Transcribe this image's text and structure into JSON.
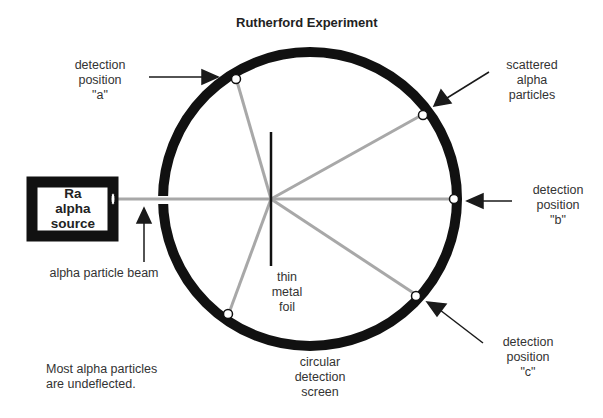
{
  "title": "Rutherford Experiment",
  "source_box": {
    "line1": "Ra",
    "line2": "alpha",
    "line3": "source"
  },
  "labels": {
    "position_a": {
      "line1": "detection",
      "line2": "position",
      "line3": "\"a\""
    },
    "scattered": {
      "line1": "scattered",
      "line2": "alpha",
      "line3": "particles"
    },
    "position_b": {
      "line1": "detection",
      "line2": "position",
      "line3": "\"b\""
    },
    "position_c": {
      "line1": "detection",
      "line2": "position",
      "line3": "\"c\""
    },
    "beam": "alpha particle beam",
    "foil": {
      "line1": "thin",
      "line2": "metal",
      "line3": "foil"
    },
    "screen": {
      "line1": "circular",
      "line2": "detection",
      "line3": "screen"
    },
    "note": {
      "line1": "Most alpha particles",
      "line2": "are undeflected."
    }
  },
  "colors": {
    "ring": "#111111",
    "path": "#a8a8a8",
    "arrow": "#1a1a1a"
  }
}
